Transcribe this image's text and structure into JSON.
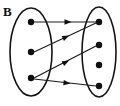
{
  "figure": {
    "label": "B",
    "type": "set-mapping-diagram",
    "background_color": "#ffffff",
    "ink_color": "#101010"
  },
  "domain_set": {
    "name": "left-set",
    "ellipse": {
      "cx": 31,
      "cy": 52,
      "rx": 21,
      "ry": 44
    },
    "nodes": [
      {
        "id": "L1",
        "cx": 31,
        "cy": 22,
        "r": 3.2
      },
      {
        "id": "L2",
        "cx": 31,
        "cy": 52,
        "r": 3.2
      },
      {
        "id": "L3",
        "cx": 31,
        "cy": 78,
        "r": 3.2
      }
    ]
  },
  "codomain_set": {
    "name": "right-set",
    "ellipse": {
      "cx": 99,
      "cy": 52,
      "rx": 17,
      "ry": 45
    },
    "nodes": [
      {
        "id": "R1",
        "cx": 99,
        "cy": 22,
        "r": 3.2
      },
      {
        "id": "R2",
        "cx": 99,
        "cy": 45,
        "r": 3.2
      },
      {
        "id": "R3",
        "cx": 99,
        "cy": 65,
        "r": 3.2
      },
      {
        "id": "R4",
        "cx": 99,
        "cy": 86,
        "r": 3.2
      }
    ]
  },
  "edges": [
    {
      "id": "E1",
      "from": "L1",
      "to": "R1",
      "x1": 34,
      "y1": 22,
      "x2": 96,
      "y2": 22,
      "head_x": 68,
      "head_y": 22
    },
    {
      "id": "E2",
      "from": "L2",
      "to": "R1",
      "x1": 34,
      "y1": 52,
      "x2": 96,
      "y2": 23,
      "head_x": 66,
      "head_y": 37
    },
    {
      "id": "E3",
      "from": "L3",
      "to": "R2",
      "x1": 34,
      "y1": 78,
      "x2": 96,
      "y2": 46,
      "head_x": 66,
      "head_y": 62
    },
    {
      "id": "E4",
      "from": "L3",
      "to": "R4",
      "x1": 34,
      "y1": 79,
      "x2": 96,
      "y2": 86,
      "head_x": 67,
      "head_y": 83
    }
  ]
}
